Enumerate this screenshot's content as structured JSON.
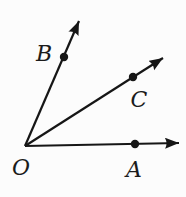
{
  "figure": {
    "type": "geometry-angle-diagram",
    "background_color": "#fcfcfc",
    "stroke_color": "#161616",
    "label_color": "#1b1b1b",
    "stroke_width": 2.2,
    "dot_radius": 4.2,
    "origin": {
      "x": 25,
      "y": 146
    },
    "origin_label": {
      "text": "O",
      "x": 21,
      "y": 167
    },
    "rays": [
      {
        "name": "ray-OB",
        "to_x": 79,
        "to_y": 21,
        "point": {
          "label": "B",
          "x": 64,
          "y": 57,
          "label_x": 44,
          "label_y": 53
        }
      },
      {
        "name": "ray-OC",
        "to_x": 163,
        "to_y": 58,
        "point": {
          "label": "C",
          "x": 133,
          "y": 77,
          "label_x": 139,
          "label_y": 99
        }
      },
      {
        "name": "ray-OA",
        "to_x": 179,
        "to_y": 143,
        "point": {
          "label": "A",
          "x": 135,
          "y": 144,
          "label_x": 134,
          "label_y": 169
        }
      }
    ]
  }
}
